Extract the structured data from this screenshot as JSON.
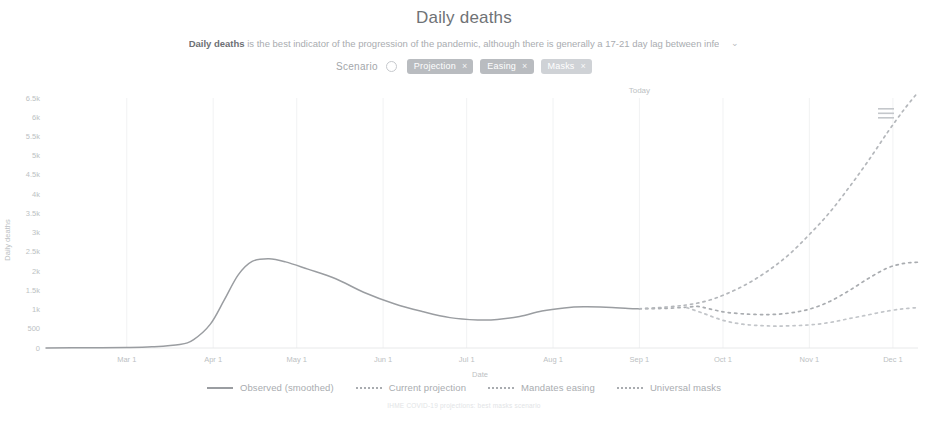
{
  "header": {
    "title": "Daily deaths",
    "subtitle_bold": "Daily deaths",
    "subtitle_rest": " is the best indicator of the progression of the pandemic, although there is generally a 17-21 day lag between infe",
    "expand_icon": "⌄"
  },
  "controls": {
    "scenario_label": "Scenario",
    "info_icon": "info-icon",
    "chips": [
      {
        "label": "Projection",
        "close": "×",
        "active": true
      },
      {
        "label": "Easing",
        "close": "×",
        "active": true
      },
      {
        "label": "Masks",
        "close": "×",
        "active": false
      }
    ]
  },
  "chart_menu": {
    "icon": "hamburger-menu-icon"
  },
  "legend": [
    {
      "label": "Observed (smoothed)",
      "style": "solid",
      "color": "#9a9da1"
    },
    {
      "label": "Current projection",
      "style": "dashed",
      "color": "#a9acb0"
    },
    {
      "label": "Mandates easing",
      "style": "dashed",
      "color": "#b4b7bb"
    },
    {
      "label": "Universal masks",
      "style": "dashed",
      "color": "#c2c5c9"
    }
  ],
  "footer": {
    "note": "IHME COVID-19 projections: best masks scenario"
  },
  "chart_data": {
    "type": "line",
    "title": "Daily deaths",
    "xlabel": "Date",
    "ylabel": "Daily deaths",
    "ylim": [
      0,
      6500
    ],
    "yticks": [
      0,
      500,
      1000,
      1500,
      2000,
      2500,
      3000,
      3500,
      4000,
      4500,
      5000,
      5500,
      6000,
      6500
    ],
    "ytick_labels": [
      "0",
      "500",
      "1k",
      "1.5k",
      "2k",
      "2.5k",
      "3k",
      "3.5k",
      "4k",
      "4.5k",
      "5k",
      "5.5k",
      "6k",
      "6.5k"
    ],
    "xticks": [
      "Mar 1",
      "Apr 1",
      "May 1",
      "Jun 1",
      "Jul 1",
      "Aug 1",
      "Sep 1",
      "Oct 1",
      "Nov 1",
      "Dec 1"
    ],
    "xlim": [
      "Feb 1",
      "Dec 10"
    ],
    "grid": true,
    "legend_position": "bottom",
    "annotations": [
      {
        "label": "Today",
        "x": "Sep 1",
        "type": "vertical-marker"
      }
    ],
    "series": [
      {
        "name": "Observed (smoothed)",
        "style": "solid",
        "color": "#9a9da1",
        "points": [
          {
            "x": "Feb 1",
            "y": 2
          },
          {
            "x": "Feb 15",
            "y": 5
          },
          {
            "x": "Mar 1",
            "y": 12
          },
          {
            "x": "Mar 10",
            "y": 30
          },
          {
            "x": "Mar 20",
            "y": 90
          },
          {
            "x": "Mar 25",
            "y": 220
          },
          {
            "x": "Mar 31",
            "y": 620
          },
          {
            "x": "Apr 5",
            "y": 1250
          },
          {
            "x": "Apr 10",
            "y": 1900
          },
          {
            "x": "Apr 15",
            "y": 2250
          },
          {
            "x": "Apr 21",
            "y": 2320
          },
          {
            "x": "Apr 27",
            "y": 2240
          },
          {
            "x": "May 5",
            "y": 2050
          },
          {
            "x": "May 15",
            "y": 1800
          },
          {
            "x": "May 25",
            "y": 1450
          },
          {
            "x": "Jun 5",
            "y": 1150
          },
          {
            "x": "Jun 15",
            "y": 950
          },
          {
            "x": "Jun 25",
            "y": 790
          },
          {
            "x": "Jul 5",
            "y": 730
          },
          {
            "x": "Jul 12",
            "y": 740
          },
          {
            "x": "Jul 20",
            "y": 820
          },
          {
            "x": "Jul 28",
            "y": 960
          },
          {
            "x": "Aug 5",
            "y": 1040
          },
          {
            "x": "Aug 12",
            "y": 1070
          },
          {
            "x": "Aug 20",
            "y": 1060
          },
          {
            "x": "Aug 28",
            "y": 1030
          },
          {
            "x": "Sep 1",
            "y": 1020
          }
        ]
      },
      {
        "name": "Current projection",
        "style": "dashed",
        "color": "#a9acb0",
        "points": [
          {
            "x": "Sep 1",
            "y": 1020
          },
          {
            "x": "Sep 10",
            "y": 1030
          },
          {
            "x": "Sep 18",
            "y": 1060
          },
          {
            "x": "Sep 22",
            "y": 1080
          },
          {
            "x": "Sep 26",
            "y": 1020
          },
          {
            "x": "Oct 2",
            "y": 930
          },
          {
            "x": "Oct 10",
            "y": 880
          },
          {
            "x": "Oct 18",
            "y": 870
          },
          {
            "x": "Oct 25",
            "y": 910
          },
          {
            "x": "Nov 1",
            "y": 1010
          },
          {
            "x": "Nov 8",
            "y": 1200
          },
          {
            "x": "Nov 15",
            "y": 1480
          },
          {
            "x": "Nov 22",
            "y": 1800
          },
          {
            "x": "Nov 29",
            "y": 2080
          },
          {
            "x": "Dec 5",
            "y": 2200
          },
          {
            "x": "Dec 10",
            "y": 2230
          }
        ]
      },
      {
        "name": "Mandates easing",
        "style": "dashed",
        "color": "#b4b7bb",
        "points": [
          {
            "x": "Sep 1",
            "y": 1020
          },
          {
            "x": "Sep 10",
            "y": 1060
          },
          {
            "x": "Sep 18",
            "y": 1120
          },
          {
            "x": "Sep 25",
            "y": 1220
          },
          {
            "x": "Oct 2",
            "y": 1400
          },
          {
            "x": "Oct 10",
            "y": 1680
          },
          {
            "x": "Oct 18",
            "y": 2050
          },
          {
            "x": "Oct 25",
            "y": 2450
          },
          {
            "x": "Nov 1",
            "y": 2950
          },
          {
            "x": "Nov 8",
            "y": 3500
          },
          {
            "x": "Nov 15",
            "y": 4150
          },
          {
            "x": "Nov 22",
            "y": 4850
          },
          {
            "x": "Nov 29",
            "y": 5600
          },
          {
            "x": "Dec 5",
            "y": 6200
          },
          {
            "x": "Dec 10",
            "y": 6650
          }
        ]
      },
      {
        "name": "Universal masks",
        "style": "dashed",
        "color": "#c2c5c9",
        "points": [
          {
            "x": "Sep 18",
            "y": 1050
          },
          {
            "x": "Sep 24",
            "y": 900
          },
          {
            "x": "Oct 1",
            "y": 720
          },
          {
            "x": "Oct 8",
            "y": 620
          },
          {
            "x": "Oct 15",
            "y": 580
          },
          {
            "x": "Oct 22",
            "y": 570
          },
          {
            "x": "Nov 1",
            "y": 600
          },
          {
            "x": "Nov 8",
            "y": 660
          },
          {
            "x": "Nov 15",
            "y": 760
          },
          {
            "x": "Nov 22",
            "y": 860
          },
          {
            "x": "Nov 29",
            "y": 960
          },
          {
            "x": "Dec 5",
            "y": 1020
          },
          {
            "x": "Dec 10",
            "y": 1050
          }
        ]
      }
    ]
  }
}
